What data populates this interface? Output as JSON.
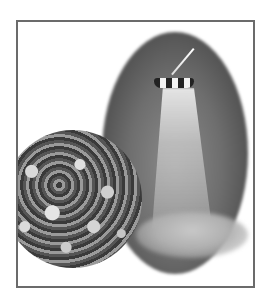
{
  "image": {
    "description": "Framed grayscale illustration of a spray nozzle dispensing powder inside a dark oval, with a circular micrograph of granules",
    "frame_color": "#6b6b6b",
    "background_color": "#ffffff",
    "elements": [
      "frame",
      "dark-oval",
      "spray-nozzle",
      "powder-spray",
      "powder-pile",
      "granule-micrograph"
    ]
  }
}
